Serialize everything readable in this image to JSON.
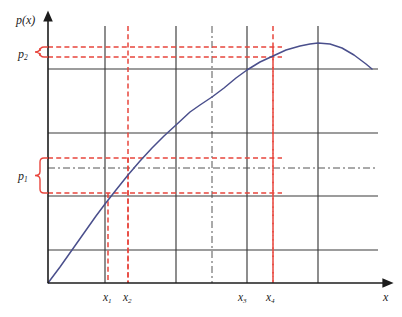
{
  "figure": {
    "width": 402,
    "height": 317,
    "background": "#ffffff"
  },
  "axes": {
    "y_axis_label": "p(x)",
    "x_axis_label": "x",
    "origin": {
      "x": 48,
      "y": 283
    },
    "x_axis_end": {
      "x": 390,
      "y": 283
    },
    "y_axis_top": {
      "x": 48,
      "y": 14
    },
    "axis_color": "#1c1c1c"
  },
  "tick_labels": [
    {
      "name": "x1",
      "text": "x",
      "subscript": "1",
      "x": 103,
      "y": 292
    },
    {
      "name": "x2",
      "text": "x",
      "subscript": "2",
      "x": 123,
      "y": 292
    },
    {
      "name": "x3",
      "text": "x",
      "subscript": "3",
      "x": 238,
      "y": 292
    },
    {
      "name": "x4",
      "text": "x",
      "subscript": "4",
      "x": 266,
      "y": 292
    }
  ],
  "band_labels": [
    {
      "name": "p2",
      "text": "p",
      "subscript": "2",
      "x": 18,
      "y": 48
    },
    {
      "name": "p1",
      "text": "p",
      "subscript": "1",
      "x": 18,
      "y": 170
    }
  ],
  "colors": {
    "curve": "#4a4f8c",
    "grid_solid": "#3a3a3a",
    "grid_dashdot": "#555555",
    "highlight": "#e8453c",
    "axis": "#1c1c1c"
  },
  "chart_data": {
    "type": "line",
    "title": "",
    "xlabel": "x",
    "ylabel": "p(x)",
    "grid": true,
    "legend": null,
    "axis_ranges": {
      "x_pixels": [
        48,
        390
      ],
      "y_pixels": [
        283,
        14
      ]
    },
    "series": [
      {
        "name": "p(x)",
        "color": "#4a4f8c",
        "style": "solid",
        "points": [
          [
            48,
            283
          ],
          [
            60,
            267
          ],
          [
            72,
            250
          ],
          [
            84,
            233
          ],
          [
            96,
            216
          ],
          [
            105,
            204
          ],
          [
            116,
            190
          ],
          [
            128,
            175
          ],
          [
            140,
            161
          ],
          [
            152,
            148
          ],
          [
            164,
            136
          ],
          [
            176,
            125
          ],
          [
            190,
            112
          ],
          [
            200,
            105
          ],
          [
            212,
            97
          ],
          [
            224,
            88
          ],
          [
            236,
            78
          ],
          [
            247,
            70
          ],
          [
            260,
            62
          ],
          [
            273,
            56
          ],
          [
            286,
            50
          ],
          [
            300,
            46
          ],
          [
            310,
            44
          ],
          [
            318,
            43
          ],
          [
            330,
            44
          ],
          [
            342,
            48
          ],
          [
            354,
            55
          ],
          [
            366,
            64
          ],
          [
            372,
            69
          ]
        ]
      }
    ],
    "vertical_gridlines": [
      {
        "name": "gridline-v-x1",
        "x": 105,
        "style": "solid",
        "color": "#3a3a3a"
      },
      {
        "name": "gridline-v-x2-highlight",
        "x": 128,
        "style": "dashed",
        "color": "#e8453c"
      },
      {
        "name": "gridline-v-mid1",
        "x": 176,
        "style": "solid",
        "color": "#3a3a3a"
      },
      {
        "name": "gridline-v-center",
        "x": 212,
        "style": "dashdot",
        "color": "#555555"
      },
      {
        "name": "gridline-v-x3",
        "x": 247,
        "style": "solid",
        "color": "#3a3a3a"
      },
      {
        "name": "gridline-v-x4-highlight",
        "x": 273,
        "style": "dashed",
        "color": "#e8453c"
      },
      {
        "name": "gridline-v-peak",
        "x": 318,
        "style": "solid",
        "color": "#3a3a3a"
      }
    ],
    "horizontal_gridlines": [
      {
        "name": "gridline-h-upper",
        "y": 69,
        "style": "solid",
        "color": "#3a3a3a"
      },
      {
        "name": "gridline-h-mid-upper",
        "y": 133,
        "style": "solid",
        "color": "#3a3a3a"
      },
      {
        "name": "gridline-h-center",
        "y": 168,
        "style": "dashdot",
        "color": "#555555"
      },
      {
        "name": "gridline-h-mid-lower",
        "y": 196,
        "style": "solid",
        "color": "#3a3a3a"
      },
      {
        "name": "gridline-h-lower",
        "y": 250,
        "style": "solid",
        "color": "#3a3a3a"
      }
    ],
    "highlight_horizontals": [
      {
        "name": "p2-upper-line",
        "y": 47,
        "x_start": 48,
        "x_end": 282,
        "color": "#e8453c"
      },
      {
        "name": "p2-lower-line",
        "y": 57,
        "x_start": 48,
        "x_end": 282,
        "color": "#e8453c"
      },
      {
        "name": "p1-upper-line",
        "y": 158,
        "x_start": 48,
        "x_end": 282,
        "color": "#e8453c"
      },
      {
        "name": "p1-lower-line",
        "y": 193,
        "x_start": 48,
        "x_end": 282,
        "color": "#e8453c"
      }
    ],
    "highlight_verticals": [
      {
        "name": "x1-drop-line",
        "x": 108,
        "y_start": 193,
        "y_end": 283,
        "color": "#e8453c"
      },
      {
        "name": "x2-drop-line",
        "x": 128,
        "y_start": 158,
        "y_end": 283,
        "color": "#e8453c"
      },
      {
        "name": "x4-drop-line",
        "x": 273,
        "y_start": 47,
        "y_end": 283,
        "color": "#e8453c"
      }
    ],
    "braces": [
      {
        "name": "p2-brace",
        "y_top": 47,
        "y_bottom": 57,
        "x": 40,
        "label": "p2"
      },
      {
        "name": "p1-brace",
        "y_top": 158,
        "y_bottom": 193,
        "x": 40,
        "label": "p1"
      }
    ],
    "annotation": "Two price bands p1 and p2 map to consumption intervals [x1,x2] and [x3,x4] on the concave curve p(x)."
  }
}
